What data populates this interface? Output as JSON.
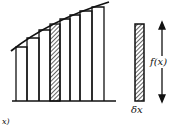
{
  "diagram": {
    "labels": {
      "height": "f(x)",
      "width": "δx",
      "cut_off": "x)"
    },
    "strips": {
      "count": 8,
      "highlighted_index": 3
    },
    "colors": {
      "ink": "#111111",
      "background": "#ffffff"
    }
  }
}
